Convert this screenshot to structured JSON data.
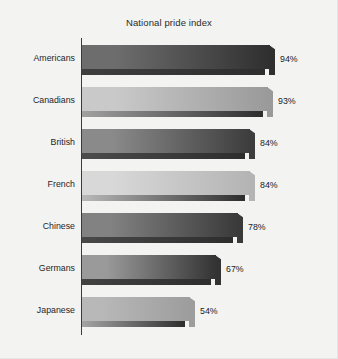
{
  "chart_data": {
    "type": "bar",
    "orientation": "horizontal",
    "title": "National pride index",
    "xlabel": "",
    "ylabel": "",
    "categories": [
      "Americans",
      "Canadians",
      "British",
      "French",
      "Chinese",
      "Germans",
      "Japanese"
    ],
    "values": [
      94,
      93,
      84,
      84,
      78,
      67,
      54
    ],
    "value_labels": [
      "94%",
      "93%",
      "84%",
      "84%",
      "78%",
      "67%",
      "54%"
    ],
    "xlim": [
      0,
      100
    ],
    "grid": false,
    "legend": false,
    "bar_colors": [
      "#6d6d6d",
      "#c9c9c9",
      "#8a8a8a",
      "#d8d8d8",
      "#828282",
      "#9a9a9a",
      "#b8b8b8"
    ],
    "bar_colors_dark": [
      "#2f2f2f",
      "#9a9a9a",
      "#3d3d3d",
      "#b4b4b4",
      "#3a3a3a",
      "#333333",
      "#9d9d9d"
    ],
    "background_color": "#f3f3f2",
    "axis_color": "#3a3a3a",
    "text_color": "#1f1f1f",
    "series": [
      {
        "name": "National pride index",
        "points": [
          {
            "category": "Americans",
            "value": 94,
            "label": "94%"
          },
          {
            "category": "Canadians",
            "value": 93,
            "label": "93%"
          },
          {
            "category": "British",
            "value": 84,
            "label": "84%"
          },
          {
            "category": "French",
            "value": 84,
            "label": "84%"
          },
          {
            "category": "Chinese",
            "value": 78,
            "label": "78%"
          },
          {
            "category": "Germans",
            "value": 67,
            "label": "67%"
          },
          {
            "category": "Japanese",
            "value": 54,
            "label": "54%"
          }
        ]
      }
    ]
  }
}
